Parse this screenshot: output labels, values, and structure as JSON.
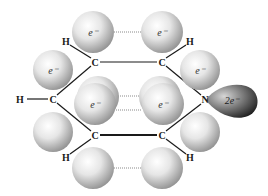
{
  "diagram": {
    "atoms": {
      "c_top_left": "C",
      "c_top_right": "C",
      "c_left": "C",
      "n_right": "N",
      "c_bottom_left": "C",
      "c_bottom_right": "C",
      "h_top_left": "H",
      "h_top_right": "H",
      "h_left": "H",
      "h_bottom_left": "H",
      "h_bottom_right": "H"
    },
    "electron_labels": {
      "top_left": "e⁻",
      "top_right": "e⁻",
      "upper_left": "e⁻",
      "upper_right": "e⁻",
      "middle_left": "e⁻",
      "middle_right": "e⁻",
      "lone_pair": "2e⁻"
    },
    "colors": {
      "sphere_light": "#f4f4f4",
      "sphere_dark": "#8c8c8c",
      "lone_pair_light": "#bdbdbd",
      "lone_pair_dark": "#2a2a2a",
      "bond": "#1a1a1a"
    }
  }
}
